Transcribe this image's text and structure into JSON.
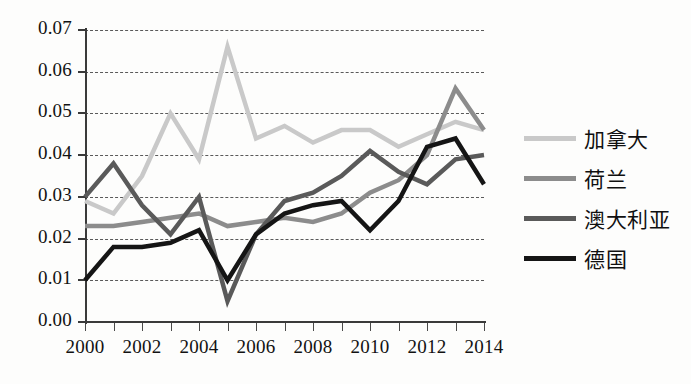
{
  "chart_data": {
    "type": "line",
    "title": "",
    "xlabel": "",
    "ylabel": "",
    "x": [
      2000,
      2001,
      2002,
      2003,
      2004,
      2005,
      2006,
      2007,
      2008,
      2009,
      2010,
      2011,
      2012,
      2013,
      2014
    ],
    "xtick_labels": [
      "2000",
      "2002",
      "2004",
      "2006",
      "2008",
      "2010",
      "2012",
      "2014"
    ],
    "xtick_years": [
      2000,
      2002,
      2004,
      2006,
      2008,
      2010,
      2012,
      2014
    ],
    "xlim": [
      2000,
      2014
    ],
    "ylim": [
      0.0,
      0.07
    ],
    "ytick_labels": [
      "0.00",
      "0.01",
      "0.02",
      "0.03",
      "0.04",
      "0.05",
      "0.06",
      "0.07"
    ],
    "ytick_values": [
      0.0,
      0.01,
      0.02,
      0.03,
      0.04,
      0.05,
      0.06,
      0.07
    ],
    "grid": true,
    "grid_axis": "y",
    "grid_style": "dashed",
    "legend_position": "right",
    "series": [
      {
        "name": "加拿大",
        "color": "#c9c9c9",
        "width": 4.5,
        "values": [
          0.029,
          0.026,
          0.035,
          0.05,
          0.039,
          0.066,
          0.044,
          0.047,
          0.043,
          0.046,
          0.046,
          0.042,
          0.045,
          0.048,
          0.046
        ]
      },
      {
        "name": "荷兰",
        "color": "#8c8c8c",
        "width": 4.5,
        "values": [
          0.023,
          0.023,
          0.024,
          0.025,
          0.026,
          0.023,
          0.024,
          0.025,
          0.024,
          0.026,
          0.031,
          0.034,
          0.04,
          0.056,
          0.046
        ]
      },
      {
        "name": "澳大利亚",
        "color": "#5a5a5a",
        "width": 4.5,
        "values": [
          0.03,
          0.038,
          0.028,
          0.021,
          0.03,
          0.005,
          0.021,
          0.029,
          0.031,
          0.035,
          0.041,
          0.036,
          0.033,
          0.039,
          0.04
        ]
      },
      {
        "name": "德国",
        "color": "#151515",
        "width": 4.5,
        "values": [
          0.01,
          0.018,
          0.018,
          0.019,
          0.022,
          0.01,
          0.021,
          0.026,
          0.028,
          0.029,
          0.022,
          0.029,
          0.042,
          0.044,
          0.033
        ]
      }
    ]
  },
  "legend": {
    "entries": [
      {
        "label": "加拿大"
      },
      {
        "label": "荷兰"
      },
      {
        "label": "澳大利亚"
      },
      {
        "label": "德国"
      }
    ]
  }
}
